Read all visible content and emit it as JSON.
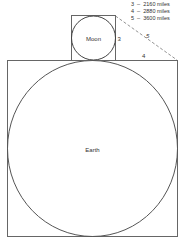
{
  "diagram": {
    "moon_label": "Moon",
    "earth_label": "Earth",
    "side_labels": {
      "three": "3",
      "four": "4",
      "five": "5"
    },
    "legend": [
      {
        "key": "3",
        "dash": "–",
        "value": "2160 miles"
      },
      {
        "key": "4",
        "dash": "–",
        "value": "2880 miles"
      },
      {
        "key": "5",
        "dash": "–",
        "value": "3600 miles"
      }
    ],
    "legend_text": [
      "3  –  2160 miles",
      "4  –  2880 miles",
      "5  –  3600 miles"
    ],
    "colors": {
      "line": "#555555",
      "text": "#333333",
      "background": "#ffffff"
    }
  }
}
